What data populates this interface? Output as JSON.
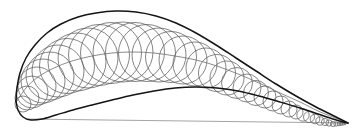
{
  "figure": {
    "background_color": "#ffffff",
    "width": 364,
    "height": 137
  },
  "style": {
    "outline_color": "#141414",
    "outline_width": 1.5,
    "circle_color": "#5d5d5d",
    "circle_width": 0.75,
    "camber_color": "#6f6f6f",
    "chord_color": "#8d8d8d"
  },
  "chart_data": {
    "type": "line",
    "xlabel": "",
    "ylabel": "",
    "xlim": [
      0,
      364
    ],
    "ylim": [
      0,
      137
    ],
    "grid": false,
    "legend": false,
    "geometry": {
      "leading_edge": [
        16,
        101
      ],
      "trailing_edge": [
        348,
        123
      ],
      "chord_length": 332,
      "max_thickness_x": 88,
      "max_thickness": 62
    },
    "series": [
      {
        "name": "upper-surface",
        "points": [
          [
            16,
            101
          ],
          [
            17,
            88
          ],
          [
            20,
            73
          ],
          [
            26,
            58
          ],
          [
            35,
            45
          ],
          [
            47,
            33
          ],
          [
            61,
            24
          ],
          [
            78,
            17
          ],
          [
            96,
            13
          ],
          [
            116,
            11
          ],
          [
            136,
            12
          ],
          [
            156,
            16
          ],
          [
            176,
            23
          ],
          [
            196,
            33
          ],
          [
            216,
            45
          ],
          [
            236,
            58
          ],
          [
            256,
            71
          ],
          [
            276,
            84
          ],
          [
            296,
            96
          ],
          [
            316,
            107
          ],
          [
            332,
            115
          ],
          [
            342,
            120
          ],
          [
            348,
            123
          ]
        ]
      },
      {
        "name": "lower-surface",
        "points": [
          [
            16,
            101
          ],
          [
            18,
            110
          ],
          [
            23,
            117
          ],
          [
            31,
            120
          ],
          [
            42,
            119
          ],
          [
            56,
            115
          ],
          [
            73,
            110
          ],
          [
            92,
            105
          ],
          [
            112,
            100
          ],
          [
            133,
            95
          ],
          [
            154,
            91
          ],
          [
            175,
            88
          ],
          [
            196,
            87
          ],
          [
            217,
            88
          ],
          [
            238,
            91
          ],
          [
            259,
            96
          ],
          [
            280,
            102
          ],
          [
            300,
            108
          ],
          [
            318,
            114
          ],
          [
            333,
            119
          ],
          [
            343,
            122
          ],
          [
            348,
            123
          ]
        ]
      },
      {
        "name": "chord-line",
        "points": [
          [
            25,
            119
          ],
          [
            348,
            123
          ]
        ]
      },
      {
        "name": "camber-line",
        "points": [
          [
            17,
            101
          ],
          [
            26,
            88
          ],
          [
            38,
            77
          ],
          [
            54,
            68
          ],
          [
            72,
            61
          ],
          [
            92,
            56
          ],
          [
            112,
            53
          ],
          [
            133,
            52
          ],
          [
            154,
            53
          ],
          [
            175,
            56
          ],
          [
            196,
            60
          ],
          [
            217,
            66
          ],
          [
            238,
            74
          ],
          [
            259,
            83
          ],
          [
            280,
            93
          ],
          [
            300,
            102
          ],
          [
            318,
            111
          ],
          [
            333,
            117
          ],
          [
            348,
            123
          ]
        ]
      }
    ],
    "inscribed_circles": [
      {
        "cx": 23,
        "cy": 104,
        "r": 8
      },
      {
        "cx": 27,
        "cy": 98,
        "r": 12
      },
      {
        "cx": 32,
        "cy": 92,
        "r": 16
      },
      {
        "cx": 37,
        "cy": 86,
        "r": 19
      },
      {
        "cx": 43,
        "cy": 81,
        "r": 22
      },
      {
        "cx": 50,
        "cy": 76,
        "r": 24
      },
      {
        "cx": 58,
        "cy": 71,
        "r": 26
      },
      {
        "cx": 67,
        "cy": 66,
        "r": 27.5
      },
      {
        "cx": 77,
        "cy": 62,
        "r": 29
      },
      {
        "cx": 88,
        "cy": 58,
        "r": 30
      },
      {
        "cx": 99,
        "cy": 55,
        "r": 30.5
      },
      {
        "cx": 111,
        "cy": 53,
        "r": 30.5
      },
      {
        "cx": 123,
        "cy": 52,
        "r": 30
      },
      {
        "cx": 135,
        "cy": 52,
        "r": 29.5
      },
      {
        "cx": 147,
        "cy": 53,
        "r": 28.5
      },
      {
        "cx": 159,
        "cy": 55,
        "r": 27
      },
      {
        "cx": 171,
        "cy": 57,
        "r": 25.5
      },
      {
        "cx": 183,
        "cy": 60,
        "r": 24
      },
      {
        "cx": 195,
        "cy": 64,
        "r": 22
      },
      {
        "cx": 206,
        "cy": 68,
        "r": 20
      },
      {
        "cx": 217,
        "cy": 73,
        "r": 18.5
      },
      {
        "cx": 227,
        "cy": 78,
        "r": 17
      },
      {
        "cx": 237,
        "cy": 83,
        "r": 15.5
      },
      {
        "cx": 247,
        "cy": 88,
        "r": 14
      },
      {
        "cx": 256,
        "cy": 93,
        "r": 12.5
      },
      {
        "cx": 265,
        "cy": 97,
        "r": 11
      },
      {
        "cx": 273,
        "cy": 101,
        "r": 10
      },
      {
        "cx": 281,
        "cy": 105,
        "r": 9
      },
      {
        "cx": 289,
        "cy": 109,
        "r": 8
      },
      {
        "cx": 296,
        "cy": 112,
        "r": 7
      },
      {
        "cx": 303,
        "cy": 115,
        "r": 6.2
      },
      {
        "cx": 309,
        "cy": 117,
        "r": 5.5
      },
      {
        "cx": 315,
        "cy": 119,
        "r": 4.8
      },
      {
        "cx": 320,
        "cy": 121,
        "r": 4.2
      },
      {
        "cx": 325,
        "cy": 122,
        "r": 3.6
      },
      {
        "cx": 329,
        "cy": 123,
        "r": 3.1
      },
      {
        "cx": 333,
        "cy": 124,
        "r": 2.6
      },
      {
        "cx": 336,
        "cy": 124,
        "r": 2.2
      },
      {
        "cx": 339,
        "cy": 124,
        "r": 1.8
      },
      {
        "cx": 341,
        "cy": 124,
        "r": 1.5
      },
      {
        "cx": 343,
        "cy": 124,
        "r": 1.2
      },
      {
        "cx": 345,
        "cy": 124,
        "r": 0.9
      }
    ]
  }
}
